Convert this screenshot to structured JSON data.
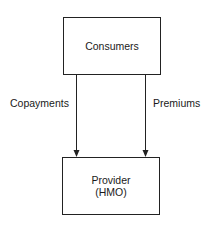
{
  "nodes": {
    "consumers": {
      "label": "Consumers"
    },
    "provider": {
      "line1": "Provider",
      "line2": "(HMO)"
    }
  },
  "edges": [
    {
      "from": "consumers",
      "to": "provider",
      "label": "Copayments"
    },
    {
      "from": "consumers",
      "to": "provider",
      "label": "Premiums"
    }
  ]
}
